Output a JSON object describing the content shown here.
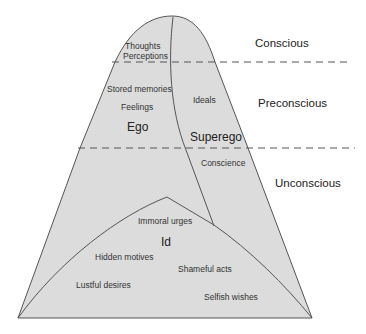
{
  "diagram": {
    "type": "iceberg-model-of-mind",
    "colors": {
      "fill": "#dcdcdc",
      "stroke": "#555555",
      "text": "#333333",
      "background": "#ffffff"
    },
    "levels": [
      {
        "label": "Conscious"
      },
      {
        "label": "Preconscious"
      },
      {
        "label": "Unconscious"
      }
    ],
    "structures": {
      "ego": "Ego",
      "superego": "Superego",
      "id": "Id"
    },
    "ego_items": [
      "Thoughts",
      "Perceptions",
      "Stored memories",
      "Feelings"
    ],
    "superego_items": [
      "Ideals",
      "Conscience"
    ],
    "id_items": [
      "Immoral urges",
      "Hidden motives",
      "Shameful acts",
      "Lustful desires",
      "Selfish wishes"
    ]
  }
}
